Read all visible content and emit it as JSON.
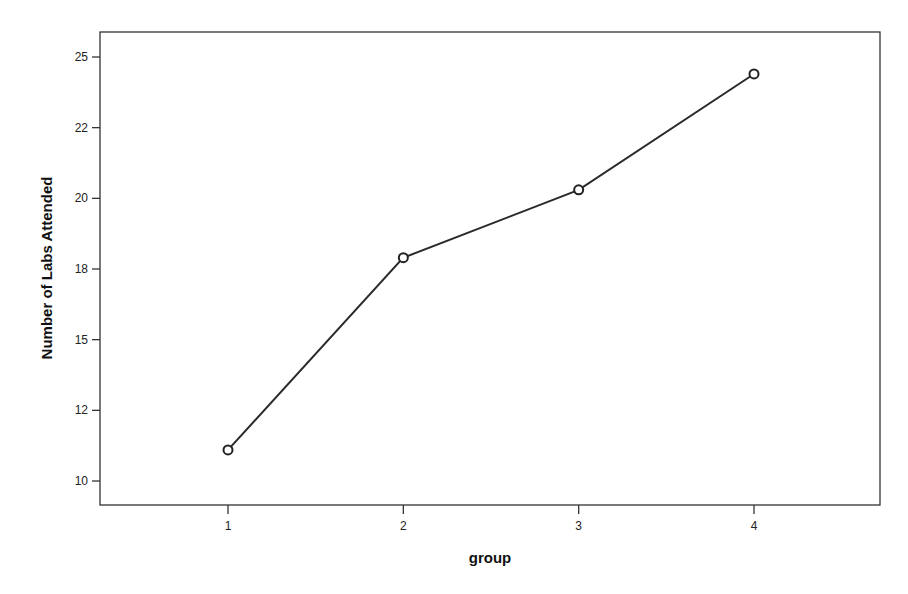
{
  "chart_data": {
    "type": "line",
    "title": "",
    "xlabel": "group",
    "ylabel": "Number of Labs Attended",
    "categories": [
      "1",
      "2",
      "3",
      "4"
    ],
    "x": [
      1,
      2,
      3,
      4
    ],
    "series": [
      {
        "name": "Number of Labs Attended",
        "values": [
          11.1,
          17.9,
          20.3,
          24.4
        ],
        "marker": "circle",
        "color": "#222222"
      }
    ],
    "yticks": [
      10,
      12.5,
      15,
      17.5,
      20,
      22.5,
      25
    ],
    "ytick_labels": [
      "10",
      "12",
      "15",
      "18",
      "20",
      "22",
      "25"
    ],
    "xticks": [
      1,
      2,
      3,
      4
    ],
    "xtick_labels": [
      "1",
      "2",
      "3",
      "4"
    ],
    "ylim": [
      9.1,
      25.9
    ],
    "xlim": [
      0.27,
      4.73
    ],
    "grid": false,
    "legend": null
  }
}
